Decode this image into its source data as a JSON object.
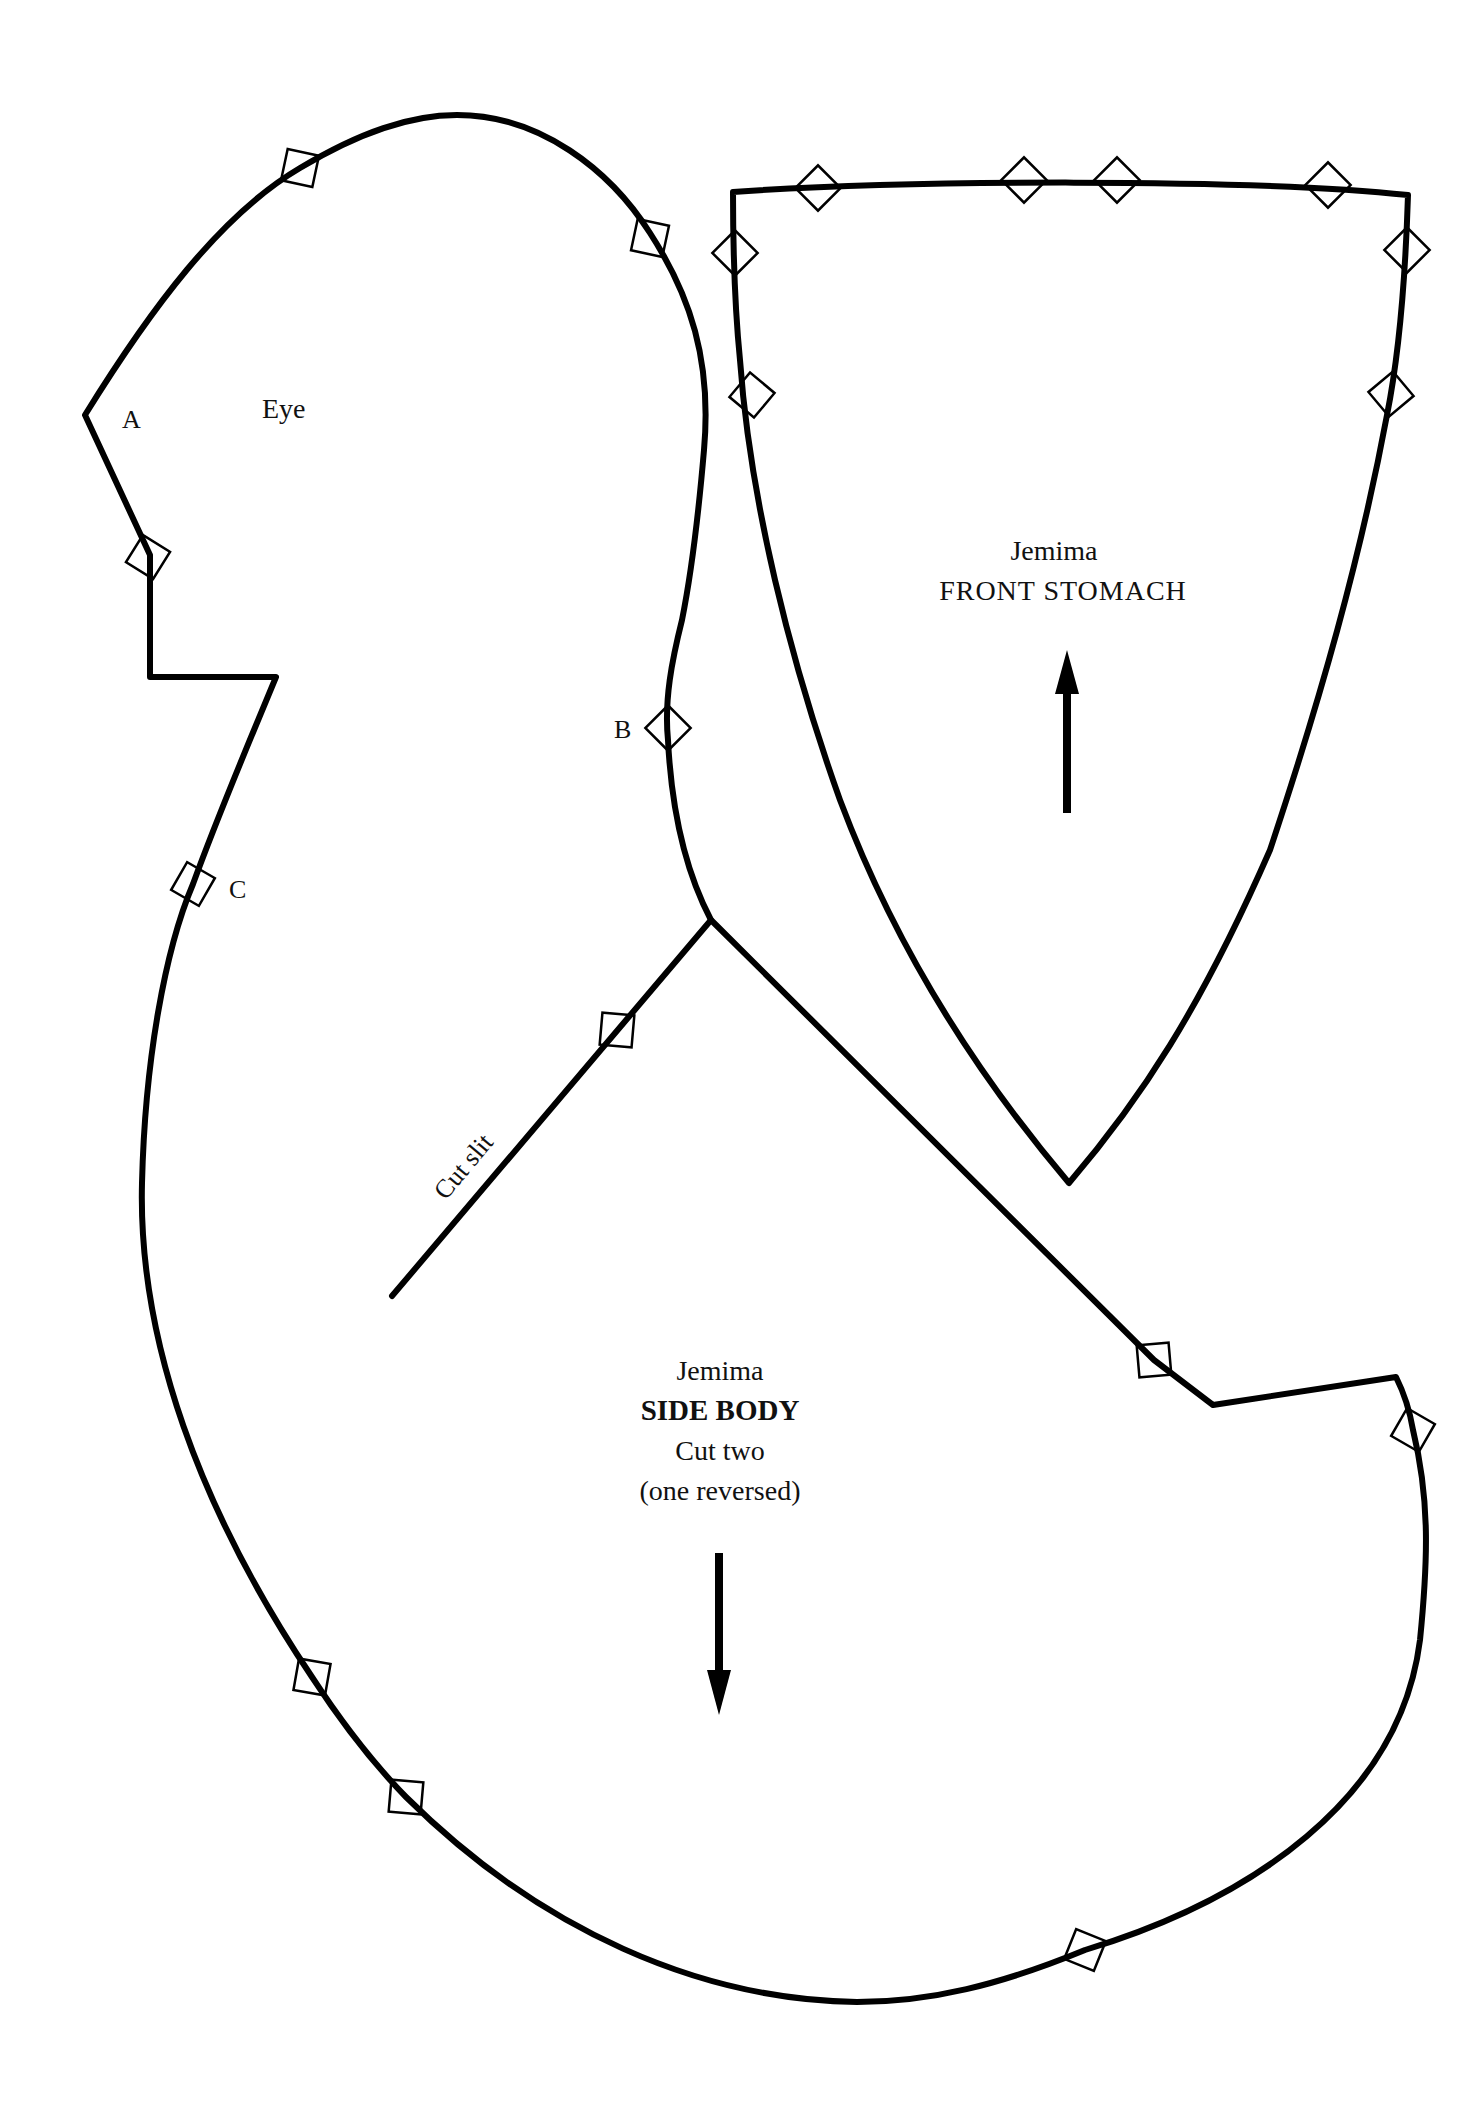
{
  "pieces": {
    "side_body": {
      "name": "Jemima",
      "title": "SIDE BODY",
      "instruction": "Cut two",
      "note": "(one reversed)",
      "grain_arrow": "down",
      "labels": {
        "a": "A",
        "b": "B",
        "c": "C",
        "eye": "Eye",
        "slit": "Cut slit"
      }
    },
    "front_stomach": {
      "name": "Jemima",
      "title": "FRONT STOMACH",
      "grain_arrow": "up"
    }
  },
  "colors": {
    "line": "#000000",
    "background": "#ffffff"
  }
}
